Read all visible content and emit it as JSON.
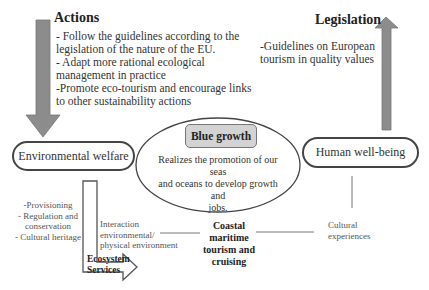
{
  "actions": {
    "title": "Actions",
    "lines": [
      "- Follow the guidelines according to the",
      "legislation of the nature of the EU.",
      "- Adapt more rational ecological",
      "management in practice",
      "-Promote eco-tourism and encourage links",
      "to other sustainability actions"
    ]
  },
  "legislation": {
    "title": "Legislation",
    "lines": [
      "-Guidelines on European",
      "tourism in quality values"
    ]
  },
  "nodes": {
    "environmental_welfare": "Environmental welfare",
    "human_well_being": "Human well-being",
    "blue_growth": {
      "title": "Blue growth",
      "lines": [
        "Realizes the promotion of our seas",
        "and oceans to develop growth and",
        "jobs."
      ]
    },
    "coastal": [
      "Coastal",
      "maritime",
      "tourism and",
      "cruising"
    ]
  },
  "ecosystem_services": {
    "label_lines": [
      "Ecosystem",
      "Services"
    ],
    "list": [
      "-Provisioning",
      "- Regulation and",
      "conservation",
      "- Cultural heritage"
    ],
    "interaction": [
      "Interaction",
      "environmental/",
      "physical environment"
    ]
  },
  "cultural": [
    "Cultural",
    "experiences"
  ],
  "colors": {
    "arrow_fill": "#8c8c8c",
    "pill_border": "#444444",
    "box_fill": "#d3d3d3"
  }
}
